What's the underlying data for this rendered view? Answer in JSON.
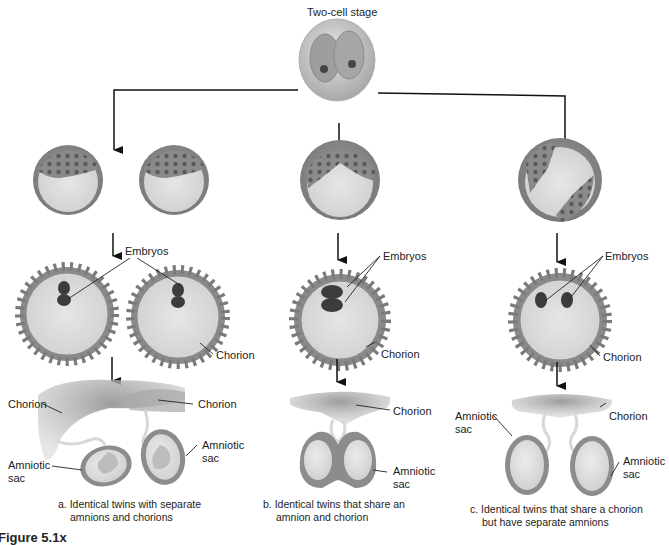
{
  "title": "Two-cell stage",
  "labels": {
    "embryos": "Embryos",
    "chorion": "Chorion",
    "amniotic_sac_line1": "Amniotic",
    "amniotic_sac_line2": "sac"
  },
  "panels": [
    {
      "id": "a",
      "caption_line1": "a. Identical twins with separate",
      "caption_line2": "amnions and chorions"
    },
    {
      "id": "b",
      "caption_line1": "b. Identical twins that share an",
      "caption_line2": "amnion and chorion"
    },
    {
      "id": "c",
      "caption_line1": "c. Identical twins that share a chorion",
      "caption_line2": "but have separate amnions"
    }
  ],
  "figure_label": "Figure 5.1x",
  "colors": {
    "cell_fill": "#d8d8d8",
    "cell_wall": "#8c8c8c",
    "cell_nucleus": "#555555",
    "embryo": "#3c3c3c",
    "chorion_spike": "#8a8a8a",
    "placenta": "#9a9a9a",
    "arrow": "#111111"
  }
}
